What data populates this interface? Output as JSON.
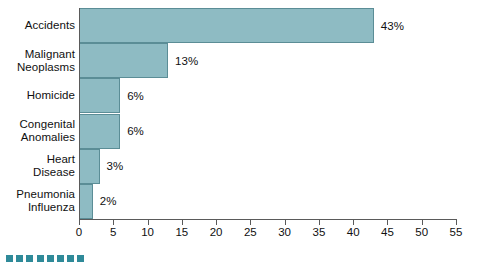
{
  "chart_data": {
    "type": "bar",
    "orientation": "horizontal",
    "title": "",
    "subtitle": "",
    "xlabel": "",
    "ylabel": "",
    "categories": [
      "Accidents",
      "Malignant Neoplasms",
      "Homicide",
      "Congenital Anomalies",
      "Heart Disease",
      "Pneumonia Influenza"
    ],
    "category_lines": [
      [
        "Accidents"
      ],
      [
        "Malignant",
        "Neoplasms"
      ],
      [
        "Homicide"
      ],
      [
        "Congenital",
        "Anomalies"
      ],
      [
        "Heart",
        "Disease"
      ],
      [
        "Pneumonia",
        "Influenza"
      ]
    ],
    "values": [
      43,
      13,
      6,
      6,
      3,
      2
    ],
    "data_labels": [
      "43%",
      "13%",
      "6%",
      "6%",
      "3%",
      "2%"
    ],
    "xlim": [
      0,
      55
    ],
    "xticks": [
      0,
      5,
      10,
      15,
      20,
      25,
      30,
      35,
      40,
      45,
      50,
      55
    ],
    "xtick_labels": [
      "0",
      "5",
      "10",
      "15",
      "20",
      "25",
      "30",
      "35",
      "40",
      "45",
      "50",
      "55"
    ],
    "grid": false,
    "legend": null,
    "bar_color": "#8ebbc3",
    "bar_edge_color": "#5b8d96",
    "axis_color": "#5a5a5a",
    "background": "#ffffff"
  },
  "decoration": {
    "square_color": "#2f8a99",
    "square_count": 8
  }
}
